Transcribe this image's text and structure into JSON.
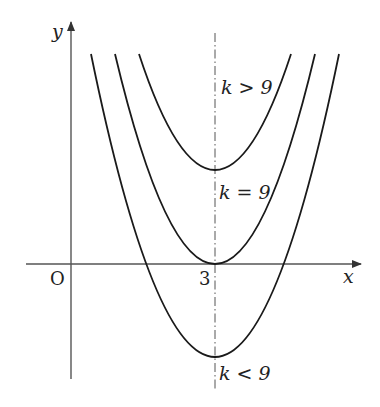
{
  "diagram": {
    "type": "parabola-family",
    "axes": {
      "x_label": "x",
      "y_label": "y",
      "origin_label": "O",
      "tick_label_x": "3"
    },
    "symmetry_axis": {
      "x_value": 3,
      "style": "dash-dot"
    },
    "curves": [
      {
        "id": "upper",
        "label": "k > 9",
        "vertex_position": "above x-axis"
      },
      {
        "id": "middle",
        "label": "k = 9",
        "vertex_position": "on x-axis"
      },
      {
        "id": "lower",
        "label": "k < 9",
        "vertex_position": "below x-axis"
      }
    ],
    "colors": {
      "curve": "#1a1a1a",
      "axis": "#555555",
      "text": "#222222"
    }
  },
  "labels": {
    "x": "x",
    "y": "y",
    "origin": "O",
    "three": "3",
    "k_gt": "k > 9",
    "k_eq": "k = 9",
    "k_lt": "k < 9"
  }
}
